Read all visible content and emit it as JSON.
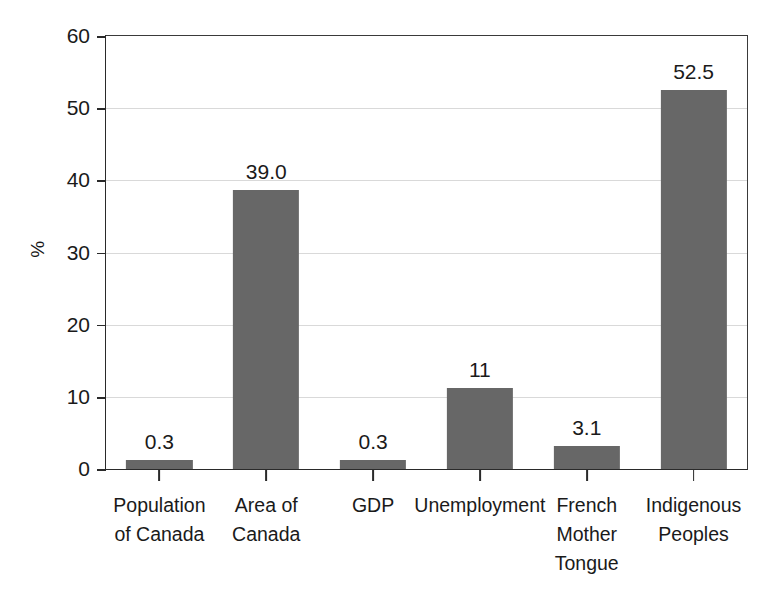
{
  "chart_data": {
    "type": "bar",
    "title": "",
    "subtitle": "",
    "xlabel": "",
    "ylabel": "%",
    "ylim": [
      0,
      60
    ],
    "yticks": [
      0,
      10,
      20,
      30,
      40,
      50,
      60
    ],
    "ytick_labels": [
      "0",
      "10",
      "20",
      "30",
      "40",
      "50",
      "60"
    ],
    "grid": true,
    "legend": false,
    "legend_position": "none",
    "bar_color": "#676767",
    "axis_color": "#2a2a2a",
    "gridline_color": "#d9d9d9",
    "categories": [
      "Population\nof Canada",
      "Area of\nCanada",
      "GDP",
      "Unemployment",
      "French\nMother\nTongue",
      "Indigenous\nPeoples"
    ],
    "values": [
      0.3,
      39.0,
      0.3,
      11,
      3.1,
      52.5
    ],
    "bar_pixel_heights": [
      1.2,
      38.6,
      1.2,
      11.2,
      3.2,
      52.5
    ],
    "data_labels": [
      "0.3",
      "39.0",
      "0.3",
      "11",
      "3.1",
      "52.5"
    ]
  }
}
